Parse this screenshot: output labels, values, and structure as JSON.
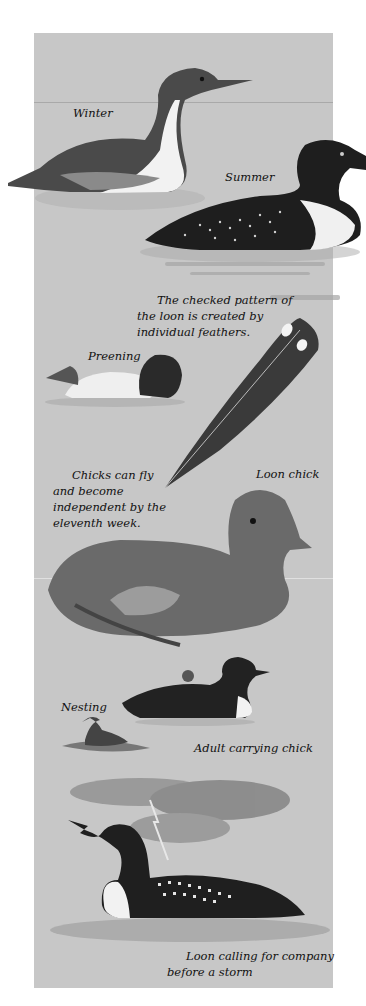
{
  "illustration": {
    "background_color": "#c7c7c7",
    "captions": {
      "winter": "Winter",
      "summer": "Summer",
      "feather_note_line1": "The checked pattern of",
      "feather_note_line2": "the loon is created by",
      "feather_note_line3": "individual feathers.",
      "preening": "Preening",
      "chick_note_line1": "Chicks can fly",
      "chick_note_line2": "and become",
      "chick_note_line3": "independent by the",
      "chick_note_line4": "eleventh week.",
      "loon_chick": "Loon chick",
      "nesting": "Nesting",
      "adult_carrying": "Adult carrying chick",
      "storm_line1": "Loon calling for company",
      "storm_line2": "before a storm"
    },
    "figures": [
      "winter-loon",
      "summer-loon",
      "preening-loon",
      "feather",
      "loon-chick",
      "adult-carrying-chick",
      "nesting-loon",
      "storm-cloud",
      "calling-loon"
    ]
  }
}
